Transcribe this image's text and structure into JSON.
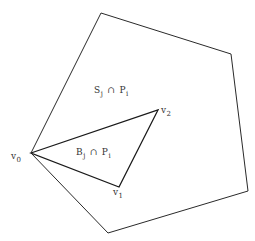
{
  "diagram": {
    "outer_polygon": {
      "name": "P_i",
      "vertices": [
        [
          31,
          153
        ],
        [
          101,
          13
        ],
        [
          231,
          54
        ],
        [
          248,
          191
        ],
        [
          108,
          233
        ]
      ],
      "stroke": "#2a2a2a"
    },
    "inner_triangle": {
      "vertices": [
        [
          31,
          153
        ],
        [
          158,
          110
        ],
        [
          119,
          187
        ]
      ],
      "stroke": "#1a1a1a"
    },
    "labels": {
      "s_region": {
        "base": "S",
        "sub1": "j",
        "op": "∩",
        "base2": "P",
        "sub2": "i"
      },
      "b_region": {
        "base": "B",
        "sub1": "j",
        "op": "∩",
        "base2": "P",
        "sub2": "i"
      },
      "v0": {
        "base": "v",
        "sub": "0"
      },
      "v1": {
        "base": "v",
        "sub": "1"
      },
      "v2": {
        "base": "v",
        "sub": "2"
      }
    }
  }
}
